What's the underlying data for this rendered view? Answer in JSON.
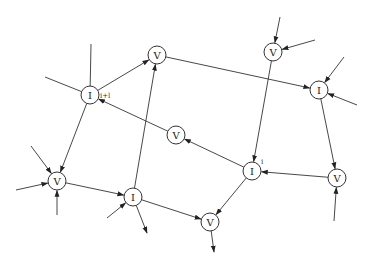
{
  "diagram": {
    "width": 370,
    "height": 274,
    "node_radius": 9,
    "stroke_color": "#333333",
    "nodes": [
      {
        "id": "I_top",
        "label": "I",
        "x": 90,
        "y": 95,
        "tag": "i+l",
        "tag_dx": 10,
        "tag_dy": 3
      },
      {
        "id": "V_top",
        "label": "V",
        "x": 157,
        "y": 55
      },
      {
        "id": "V_tr",
        "label": "V",
        "x": 273,
        "y": 52
      },
      {
        "id": "I_right",
        "label": "I",
        "x": 319,
        "y": 90
      },
      {
        "id": "V_mid",
        "label": "V",
        "x": 176,
        "y": 135
      },
      {
        "id": "I_center",
        "label": "I",
        "x": 252,
        "y": 171,
        "tag": "i",
        "tag_dx": 9,
        "tag_dy": -7
      },
      {
        "id": "V_br",
        "label": "V",
        "x": 337,
        "y": 178
      },
      {
        "id": "V_left",
        "label": "V",
        "x": 57,
        "y": 181
      },
      {
        "id": "I_bl",
        "label": "I",
        "x": 133,
        "y": 197
      },
      {
        "id": "V_bottom",
        "label": "V",
        "x": 210,
        "y": 222
      }
    ],
    "edges": [
      {
        "from": "I_top",
        "to": "V_top",
        "arrow": true
      },
      {
        "from": "V_top",
        "to": "I_right",
        "arrow": true
      },
      {
        "from": "V_tr",
        "to": "I_center",
        "arrow": true
      },
      {
        "from": "I_right",
        "to": "V_br",
        "arrow": true
      },
      {
        "from": "V_br",
        "to": "I_center",
        "arrow": true
      },
      {
        "from": "I_center",
        "to": "V_mid",
        "arrow": true
      },
      {
        "from": "V_mid",
        "to": "I_top",
        "arrow": true
      },
      {
        "from": "I_top",
        "to": "V_left",
        "arrow": true
      },
      {
        "from": "V_left",
        "to": "I_bl",
        "arrow": true
      },
      {
        "from": "I_bl",
        "to": "V_top",
        "arrow": true
      },
      {
        "from": "I_bl",
        "to": "V_bottom",
        "arrow": true
      },
      {
        "from": "I_center",
        "to": "V_bottom",
        "arrow": true
      }
    ],
    "stubs": [
      {
        "node": "I_top",
        "x": 91,
        "y": 44,
        "dir": "none"
      },
      {
        "node": "I_top",
        "x": 45,
        "y": 77,
        "dir": "none"
      },
      {
        "node": "V_tr",
        "x": 280,
        "y": 17,
        "dir": "in"
      },
      {
        "node": "V_tr",
        "x": 315,
        "y": 40,
        "dir": "in"
      },
      {
        "node": "I_right",
        "x": 344,
        "y": 57,
        "dir": "in"
      },
      {
        "node": "I_right",
        "x": 357,
        "y": 105,
        "dir": "in"
      },
      {
        "node": "V_br",
        "x": 334,
        "y": 221,
        "dir": "in"
      },
      {
        "node": "V_left",
        "x": 31,
        "y": 146,
        "dir": "in"
      },
      {
        "node": "V_left",
        "x": 16,
        "y": 190,
        "dir": "in"
      },
      {
        "node": "V_left",
        "x": 57,
        "y": 215,
        "dir": "in"
      },
      {
        "node": "I_bl",
        "x": 107,
        "y": 218,
        "dir": "in"
      },
      {
        "node": "I_bl",
        "x": 147,
        "y": 233,
        "dir": "out"
      },
      {
        "node": "V_bottom",
        "x": 214,
        "y": 252,
        "dir": "out"
      }
    ]
  }
}
